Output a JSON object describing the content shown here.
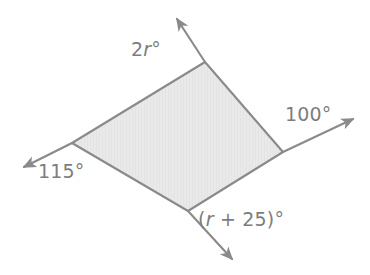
{
  "figure": {
    "type": "geometry-diagram",
    "colors": {
      "background": "#ffffff",
      "fill": "#e8e8e8",
      "stroke": "#8a8a8a",
      "text": "#7d7d7d"
    },
    "shape": {
      "name": "quadrilateral",
      "vertices": [
        {
          "name": "top",
          "x": 205,
          "y": 62
        },
        {
          "name": "right",
          "x": 283,
          "y": 152
        },
        {
          "name": "bottom",
          "x": 188,
          "y": 211
        },
        {
          "name": "left",
          "x": 72,
          "y": 143
        }
      ]
    },
    "rays": [
      {
        "name": "ray-top",
        "from_x": 205,
        "from_y": 62,
        "to_x": 175,
        "to_y": 16
      },
      {
        "name": "ray-right",
        "from_x": 283,
        "from_y": 152,
        "to_x": 357,
        "to_y": 117
      },
      {
        "name": "ray-bottom",
        "from_x": 188,
        "from_y": 211,
        "to_x": 236,
        "to_y": 263
      },
      {
        "name": "ray-left",
        "from_x": 72,
        "from_y": 143,
        "to_x": 19,
        "to_y": 169
      }
    ],
    "labels": {
      "top": {
        "prefix": "2",
        "variable": "r",
        "suffix": "°"
      },
      "right": {
        "text": "100°"
      },
      "bottom": {
        "prefix": "(",
        "variable": "r",
        "suffix": " + 25)°"
      },
      "left": {
        "text": "115°"
      }
    }
  }
}
